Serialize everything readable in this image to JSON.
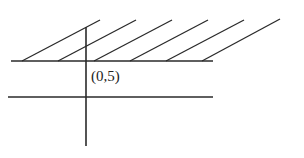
{
  "diagram": {
    "label": "(0,5)",
    "stroke_color": "#2a2a2a",
    "axis_vertical": {
      "x": 86,
      "y1": 27,
      "y2": 146
    },
    "line_upper": {
      "y": 61,
      "x1": 11,
      "x2": 213
    },
    "line_lower": {
      "y": 97,
      "x1": 8,
      "x2": 213
    },
    "hatch_lines": [
      {
        "x1": 22,
        "y1": 61,
        "x2": 100,
        "y2": 20
      },
      {
        "x1": 58,
        "y1": 61,
        "x2": 136,
        "y2": 20
      },
      {
        "x1": 94,
        "y1": 61,
        "x2": 172,
        "y2": 20
      },
      {
        "x1": 130,
        "y1": 61,
        "x2": 208,
        "y2": 20
      },
      {
        "x1": 166,
        "y1": 61,
        "x2": 244,
        "y2": 20
      },
      {
        "x1": 202,
        "y1": 61,
        "x2": 280,
        "y2": 19
      }
    ]
  }
}
